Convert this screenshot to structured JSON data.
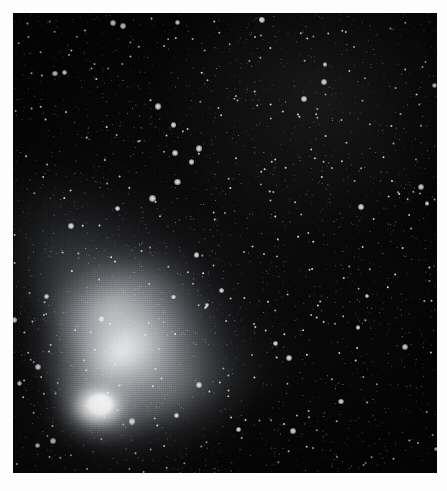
{
  "image": {
    "kind": "astrophotograph",
    "subject": "comet",
    "subject_description": "Bright comet with a teardrop-shaped coma at lower left and two tails streaming diagonally toward the upper right across a dense star field",
    "palette": "monochrome-grayscale",
    "border_color": "#fdfdfd",
    "sky_color": "#040404",
    "comet_color": "#ffffff",
    "star_color": "#e8e8ec",
    "width": 447,
    "height": 491,
    "border_width_px": 13,
    "field": {
      "left": 13,
      "top": 13,
      "width": 424,
      "height": 460
    },
    "texture": "horizontal film scan lines with fine vertical grain"
  },
  "comet": {
    "nucleus": {
      "x": 88,
      "y": 392,
      "brightness": "saturated-white"
    },
    "coma": {
      "center_x": 95,
      "center_y": 390,
      "width": 140,
      "height": 110,
      "shape": "teardrop"
    },
    "tails": [
      {
        "name": "dust-tail",
        "type": "dust",
        "appearance": "broad bright curved fan",
        "angle_deg": 34,
        "direction": "upper-right",
        "relative_brightness": 1.0
      },
      {
        "name": "ion-tail",
        "type": "ion",
        "appearance": "narrow straight diffuse streamer",
        "angle_deg": 50,
        "direction": "upper-right",
        "relative_brightness": 0.45
      },
      {
        "name": "ion-tail-outer",
        "type": "ion",
        "appearance": "faint wide outer halo fading to upper right",
        "angle_deg": 56,
        "direction": "upper-right",
        "relative_brightness": 0.22
      }
    ]
  },
  "starfield": {
    "density": "very-high",
    "approx_star_count": 2600,
    "size_range_px": [
      0.5,
      3.2
    ],
    "bright_star_count": 46,
    "distribution": "uniform random across field"
  }
}
